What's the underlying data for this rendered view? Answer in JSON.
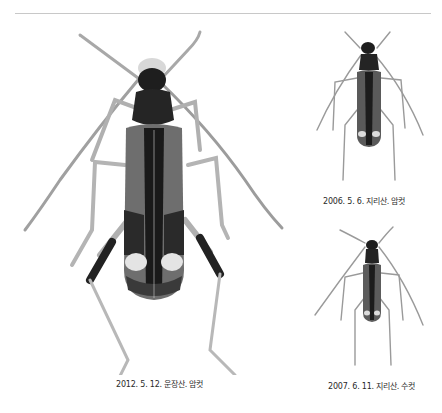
{
  "plate": {
    "divider": "horizontal-rule",
    "specimens": [
      {
        "id": "main",
        "caption": "2012. 5. 12. 운장산. 암컷",
        "subject": "longhorn-beetle-dorsal-view",
        "size": "large"
      },
      {
        "id": "top-right",
        "caption": "2006. 5. 6. 지리산. 암컷",
        "subject": "longhorn-beetle-dorsal-view",
        "size": "small"
      },
      {
        "id": "bottom-right",
        "caption": "2007. 6. 11. 지리산. 수컷",
        "subject": "longhorn-beetle-dorsal-view",
        "size": "small"
      }
    ]
  },
  "colors": {
    "background": "#ffffff",
    "rule": "#c8c8c8",
    "body_dark": "#1e1e1e",
    "elytra_gray": "#6a6a6a",
    "leg_light": "#b8b8b8",
    "spot_light": "#e2e2e2",
    "caption_text": "#2a2a2a"
  }
}
